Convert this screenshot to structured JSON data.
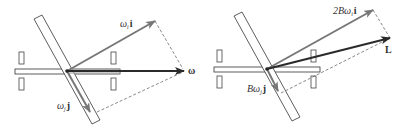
{
  "figure": {
    "left_panel": {
      "labels": {
        "omega_i_i": {
          "sym": "ω",
          "sub": "i",
          "vec": "i"
        },
        "omega_j_j": {
          "sym": "ω",
          "sub": "j",
          "vec": "j"
        },
        "omega": {
          "vec": "ω"
        }
      }
    },
    "right_panel": {
      "labels": {
        "two_b_omega_i_i": {
          "coef": "2B",
          "sym": "ω",
          "sub": "i",
          "vec": "i"
        },
        "b_omega_j_j": {
          "coef": "B",
          "sym": "ω",
          "sub": "j",
          "vec": "j"
        },
        "L": {
          "vec": "L"
        }
      }
    },
    "colors": {
      "outline": "#333333",
      "vector_light": "#777777",
      "vector_dark": "#2a2a2a",
      "dashed": "#555555"
    }
  }
}
